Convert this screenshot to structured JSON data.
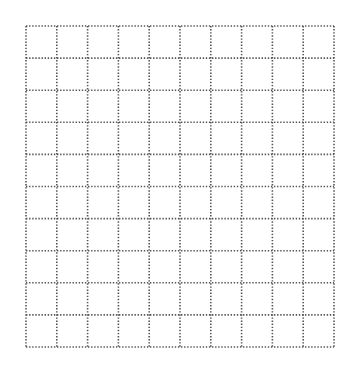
{
  "grid": {
    "rows": 10,
    "columns": 10,
    "left": 26,
    "top": 26,
    "right": 334,
    "bottom": 347,
    "line_style": "dotted",
    "dot_color": "#555555",
    "background": "#ffffff"
  }
}
